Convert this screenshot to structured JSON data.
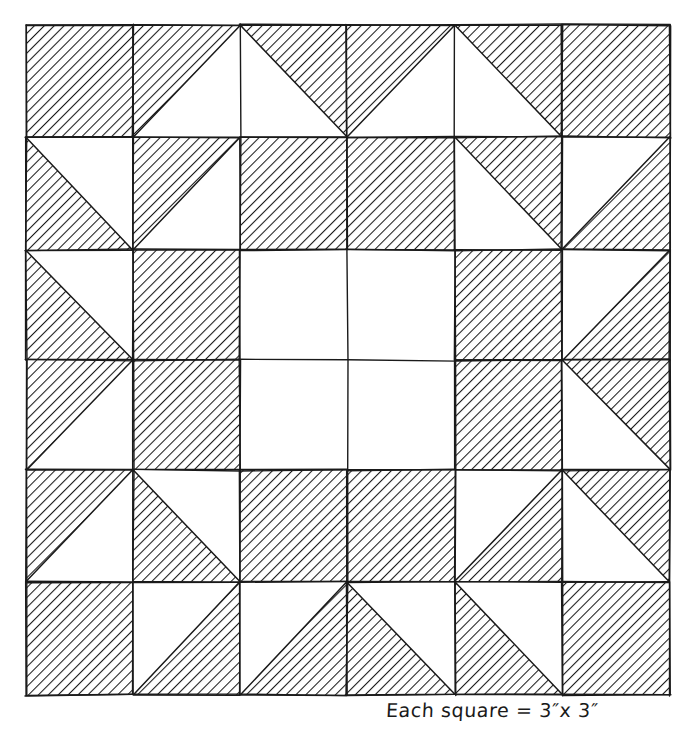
{
  "figure": {
    "name": "quilt-block-diagram",
    "caption": "Each square = 3″x 3″",
    "caption_plain": "Each square = 3\" x 3\"",
    "square_size_label": "3″ x 3″",
    "ink_color": "#1a1a1a",
    "paper_color": "#ffffff",
    "hatch_color": "#1a1a1a",
    "hatch_direction": "nw-se",
    "grid": {
      "rows": 6,
      "cols": 6,
      "left": 26,
      "top": 25,
      "right": 670,
      "bottom": 695,
      "col_edges": [
        26,
        133,
        240,
        347,
        455,
        562,
        670
      ],
      "row_edges": [
        25,
        137,
        250,
        360,
        470,
        582,
        695
      ]
    },
    "legend": {
      "full_label": "shaded square",
      "empty_label": "plain square",
      "triangle_labels": {
        "nw": "half-square triangle, upper-left shaded",
        "ne": "half-square triangle, upper-right shaded",
        "sw": "half-square triangle, lower-left shaded",
        "se": "half-square triangle, lower-right shaded"
      }
    },
    "cells": [
      [
        {
          "id": "r1c1",
          "fill": "full"
        },
        {
          "id": "r1c2",
          "fill": "nw"
        },
        {
          "id": "r1c3",
          "fill": "ne"
        },
        {
          "id": "r1c4",
          "fill": "nw"
        },
        {
          "id": "r1c5",
          "fill": "ne"
        },
        {
          "id": "r1c6",
          "fill": "full"
        }
      ],
      [
        {
          "id": "r2c1",
          "fill": "sw"
        },
        {
          "id": "r2c2",
          "fill": "nw"
        },
        {
          "id": "r2c3",
          "fill": "full"
        },
        {
          "id": "r2c4",
          "fill": "full"
        },
        {
          "id": "r2c5",
          "fill": "ne"
        },
        {
          "id": "r2c6",
          "fill": "se"
        }
      ],
      [
        {
          "id": "r3c1",
          "fill": "sw"
        },
        {
          "id": "r3c2",
          "fill": "full"
        },
        {
          "id": "r3c3",
          "fill": "none"
        },
        {
          "id": "r3c4",
          "fill": "none"
        },
        {
          "id": "r3c5",
          "fill": "full"
        },
        {
          "id": "r3c6",
          "fill": "se"
        }
      ],
      [
        {
          "id": "r4c1",
          "fill": "nw"
        },
        {
          "id": "r4c2",
          "fill": "full"
        },
        {
          "id": "r4c3",
          "fill": "none"
        },
        {
          "id": "r4c4",
          "fill": "none"
        },
        {
          "id": "r4c5",
          "fill": "full"
        },
        {
          "id": "r4c6",
          "fill": "ne"
        }
      ],
      [
        {
          "id": "r5c1",
          "fill": "nw"
        },
        {
          "id": "r5c2",
          "fill": "sw"
        },
        {
          "id": "r5c3",
          "fill": "full"
        },
        {
          "id": "r5c4",
          "fill": "full"
        },
        {
          "id": "r5c5",
          "fill": "se"
        },
        {
          "id": "r5c6",
          "fill": "ne"
        }
      ],
      [
        {
          "id": "r6c1",
          "fill": "full"
        },
        {
          "id": "r6c2",
          "fill": "se"
        },
        {
          "id": "r6c3",
          "fill": "se"
        },
        {
          "id": "r6c4",
          "fill": "sw"
        },
        {
          "id": "r6c5",
          "fill": "sw"
        },
        {
          "id": "r6c6",
          "fill": "full"
        }
      ]
    ]
  }
}
